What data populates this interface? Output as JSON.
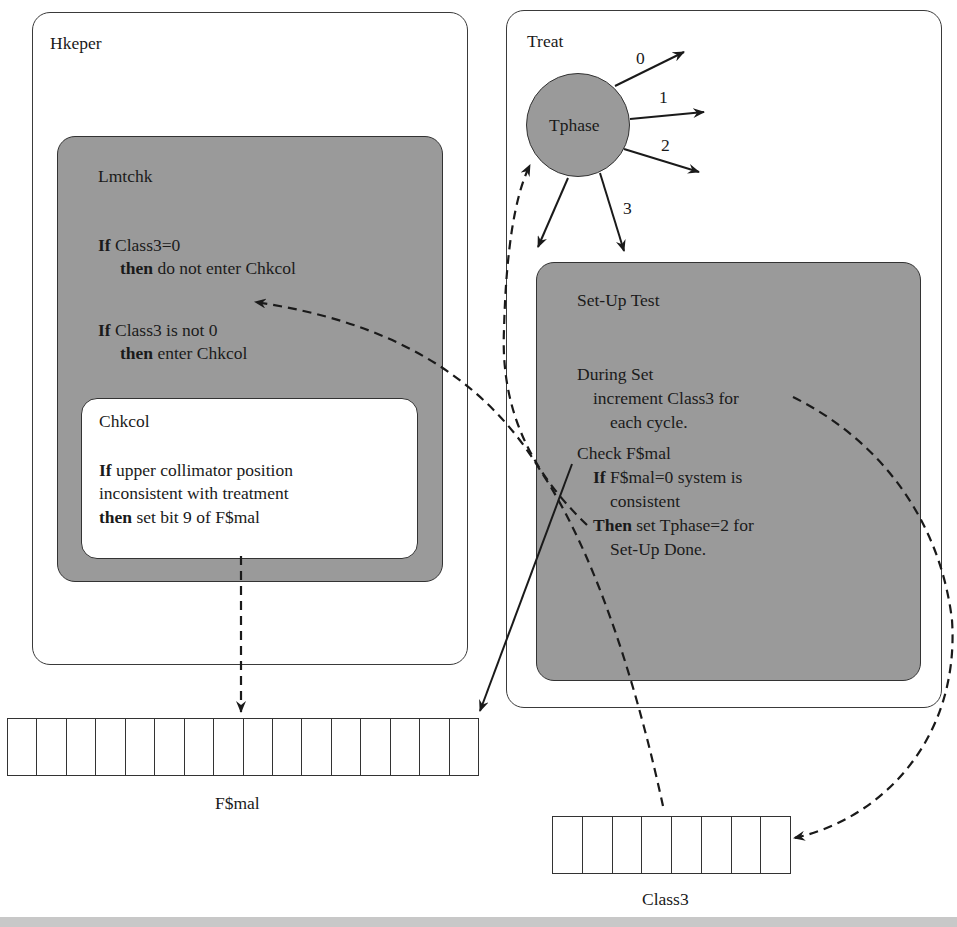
{
  "hkeper": {
    "title": "Hkeper",
    "lmtchk": {
      "title": "Lmtchk",
      "rule1": {
        "kw_if": "If",
        "cond": " Class3=0",
        "kw_then": "then",
        "action": " do not enter Chkcol"
      },
      "rule2": {
        "kw_if": "If",
        "cond": " Class3 is not 0",
        "kw_then": "then",
        "action": " enter Chkcol"
      },
      "chkcol": {
        "title": "Chkcol",
        "kw_if": "If",
        "line1": " upper collimator position",
        "line2": "inconsistent with treatment",
        "kw_then": "then",
        "line3": " set bit 9 of F$mal"
      }
    }
  },
  "treat": {
    "title": "Treat",
    "tphase": {
      "label": "Tphase",
      "branches": [
        "0",
        "1",
        "2",
        "3"
      ]
    },
    "setup_test": {
      "title": "Set-Up Test",
      "during": "During Set",
      "increment": "increment Class3 for",
      "each_cycle": "each cycle.",
      "check": "Check F$mal",
      "kw_if": "If",
      "if_cond": " F$mal=0 system is",
      "consistent": "consistent",
      "kw_then": "Then",
      "then_action": " set Tphase=2 for",
      "setup_done": "Set-Up Done."
    }
  },
  "registers": {
    "fsmal": {
      "label": "F$mal",
      "cells": 16
    },
    "class3": {
      "label": "Class3",
      "cells": 8
    }
  },
  "colors": {
    "grey_fill": "#9a9a9a",
    "line": "#1a1a1a",
    "bottom_bar": "#c8c8c8"
  }
}
